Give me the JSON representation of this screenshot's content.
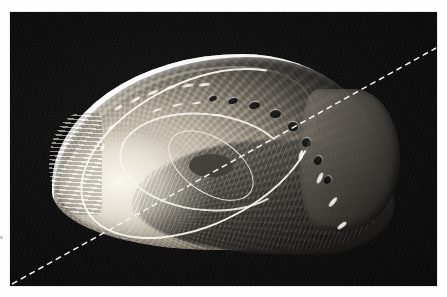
{
  "page": {
    "background_color": "#ffffff",
    "type": "scanned-photograph-figure"
  },
  "photograph": {
    "subject": "abalone shell",
    "scientific_group": "Haliotis",
    "view": "exterior dorsal view",
    "medium": "black and white halftone photograph",
    "background_color": "#0b0b0b",
    "bounds": {
      "left": 10,
      "top": 12,
      "width": 427,
      "height": 274
    },
    "description": "Ear-shaped abalone shell lit from the upper left, showing a bright iridescent nacre rim, radial growth striations fanning from a low spiral apex, and a curving row of respiratory pores along the upper right margin."
  },
  "shell": {
    "name": "abalone-shell",
    "apex_position": {
      "x": 105,
      "y": 210
    },
    "bright_rim_edge": "upper-left",
    "shadow_region": "lower-right",
    "pores": [
      {
        "index": 1,
        "left": 157,
        "top": 42,
        "w": 8,
        "h": 5,
        "rot": -22
      },
      {
        "index": 2,
        "left": 176,
        "top": 44,
        "w": 10,
        "h": 6,
        "rot": -18
      },
      {
        "index": 3,
        "left": 197,
        "top": 48,
        "w": 11,
        "h": 7,
        "rot": -12
      },
      {
        "index": 4,
        "left": 218,
        "top": 56,
        "w": 11,
        "h": 8,
        "rot": -4
      },
      {
        "index": 5,
        "left": 236,
        "top": 68,
        "w": 10,
        "h": 9,
        "rot": 8
      },
      {
        "index": 6,
        "left": 250,
        "top": 84,
        "w": 9,
        "h": 9,
        "rot": 20
      },
      {
        "index": 7,
        "left": 262,
        "top": 102,
        "w": 8,
        "h": 9,
        "rot": 32
      },
      {
        "index": 8,
        "left": 272,
        "top": 122,
        "w": 7,
        "h": 8,
        "rot": 42
      }
    ],
    "flecks": [
      {
        "left": 62,
        "top": 52,
        "w": 9,
        "h": 3,
        "rot": -34
      },
      {
        "left": 78,
        "top": 44,
        "w": 11,
        "h": 3,
        "rot": -30
      },
      {
        "left": 95,
        "top": 37,
        "w": 12,
        "h": 3,
        "rot": -24
      },
      {
        "left": 112,
        "top": 32,
        "w": 13,
        "h": 3,
        "rot": -18
      },
      {
        "left": 130,
        "top": 30,
        "w": 12,
        "h": 3,
        "rot": -12
      },
      {
        "left": 147,
        "top": 29,
        "w": 11,
        "h": 3,
        "rot": -8
      },
      {
        "left": 55,
        "top": 72,
        "w": 8,
        "h": 3,
        "rot": -44
      },
      {
        "left": 47,
        "top": 92,
        "w": 7,
        "h": 3,
        "rot": -62
      },
      {
        "left": 100,
        "top": 55,
        "w": 10,
        "h": 2,
        "rot": -20
      },
      {
        "left": 120,
        "top": 50,
        "w": 10,
        "h": 2,
        "rot": -14
      },
      {
        "left": 140,
        "top": 48,
        "w": 9,
        "h": 2,
        "rot": -9
      },
      {
        "left": 161,
        "top": 60,
        "w": 8,
        "h": 2,
        "rot": -2
      },
      {
        "left": 247,
        "top": 96,
        "w": 4,
        "h": 11,
        "rot": 14
      },
      {
        "left": 266,
        "top": 118,
        "w": 4,
        "h": 12,
        "rot": 26
      },
      {
        "left": 279,
        "top": 142,
        "w": 4,
        "h": 12,
        "rot": 40
      },
      {
        "left": 288,
        "top": 166,
        "w": 4,
        "h": 11,
        "rot": 52
      }
    ]
  },
  "overlay_line": {
    "name": "dashed-diagonal-line",
    "style": "dashed",
    "color": "#f2f2f2",
    "thickness_px": 1.5,
    "dash_length_px": 6,
    "gap_length_px": 4,
    "start": {
      "x": 2,
      "y": 272
    },
    "end": {
      "x": 426,
      "y": 36
    }
  },
  "marginalia": {
    "left_fragment": "s",
    "right_tick_present": true
  }
}
